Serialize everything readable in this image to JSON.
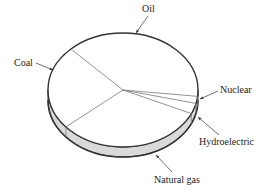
{
  "chart_data": {
    "type": "pie",
    "style": "3d-oblique",
    "title": "",
    "categories": [
      "Oil",
      "Nuclear",
      "Hydroelectric",
      "Natural gas",
      "Coal"
    ],
    "values": [
      39,
      2,
      3,
      32,
      24
    ],
    "unit": "percent (estimated from slice angles)",
    "labels": [
      {
        "name": "Oil",
        "text": "Oil",
        "x": 142,
        "y": 12,
        "anchor": "start",
        "arrow": [
          [
            148,
            16
          ],
          [
            136,
            33
          ]
        ]
      },
      {
        "name": "Coal",
        "text": "Coal",
        "x": 14,
        "y": 66,
        "anchor": "start",
        "arrow": [
          [
            36,
            63
          ],
          [
            53,
            70
          ]
        ]
      },
      {
        "name": "Nuclear",
        "text": "Nuclear",
        "x": 220,
        "y": 93,
        "anchor": "start",
        "arrow": [
          [
            218,
            91
          ],
          [
            200,
            99
          ]
        ]
      },
      {
        "name": "Hydroelectric",
        "text": "Hydroelectric",
        "x": 199,
        "y": 145,
        "anchor": "start",
        "arrow": [
          [
            219,
            135
          ],
          [
            198,
            117
          ]
        ]
      },
      {
        "name": "Natural gas",
        "text": "Natural gas",
        "x": 154,
        "y": 183,
        "anchor": "start",
        "arrow": [
          [
            172,
            172
          ],
          [
            156,
            155
          ]
        ]
      }
    ],
    "legend": "none",
    "grid": false
  },
  "geometry": {
    "cx": 123,
    "cy": 90,
    "rx": 75,
    "ry": 57,
    "depth": 10,
    "start_angle_deg": 316,
    "top_fill": "#ffffff",
    "side_fill": "#d9d9d9",
    "outline": "#333333",
    "divider": "#777777"
  }
}
